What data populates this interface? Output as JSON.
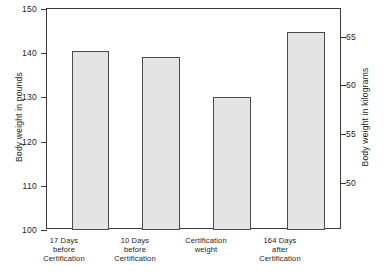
{
  "chart_data": {
    "type": "bar",
    "title": "",
    "subtitle": "",
    "categories": [
      "17 Days before Certification",
      "10 Days before Certification",
      "Certification weight",
      "164 Days after Certification"
    ],
    "category_lines": [
      [
        "17 Days",
        "before",
        "Certification"
      ],
      [
        "10 Days",
        "before",
        "Certification"
      ],
      [
        "Certification",
        "weight"
      ],
      [
        "164 Days",
        "after",
        "Certification"
      ]
    ],
    "values": [
      140.5,
      139.2,
      130.2,
      144.8
    ],
    "values_kilograms": [
      63.7,
      63.1,
      59.1,
      65.7
    ],
    "xlabel": "",
    "ylabel": "Body weight in pounds",
    "ylabel_secondary": "Body weight in kilograms",
    "ylim": [
      100,
      150
    ],
    "ylim_secondary": [
      45.36,
      68.04
    ],
    "yticks": [
      150,
      140,
      130,
      120,
      110,
      100
    ],
    "yticks_secondary": [
      65,
      60,
      55,
      50
    ],
    "grid": false,
    "legend": null,
    "bar_fill_color": "#e4e4e4",
    "bar_edge_color": "#4a4a4a",
    "axis_color": "#3a3a3a",
    "background_color": "#ffffff"
  },
  "axes": {
    "left": {
      "title": "Body weight in pounds",
      "ticks": [
        {
          "label": "150",
          "value": 150
        },
        {
          "label": "140",
          "value": 140
        },
        {
          "label": "130",
          "value": 130
        },
        {
          "label": "120",
          "value": 120
        },
        {
          "label": "110",
          "value": 110
        },
        {
          "label": "100",
          "value": 100
        }
      ]
    },
    "right": {
      "title": "Body weight in kilograms",
      "ticks": [
        {
          "label": "65",
          "value": 65
        },
        {
          "label": "60",
          "value": 60
        },
        {
          "label": "55",
          "value": 55
        },
        {
          "label": "50",
          "value": 50
        }
      ]
    }
  },
  "bars": [
    {
      "label_line1": "17 Days",
      "label_line2": "before",
      "label_line3": "Certification",
      "value": 140.5
    },
    {
      "label_line1": "10 Days",
      "label_line2": "before",
      "label_line3": "Certification",
      "value": 139.2
    },
    {
      "label_line1": "Certification",
      "label_line2": "weight",
      "label_line3": "",
      "value": 130.2
    },
    {
      "label_line1": "164 Days",
      "label_line2": "after",
      "label_line3": "Certification",
      "value": 144.8
    }
  ]
}
